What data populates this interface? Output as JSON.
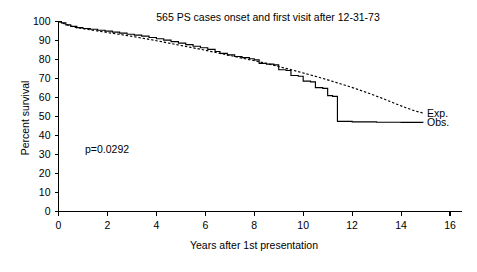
{
  "chart_data": {
    "type": "line",
    "title": "565 PS cases onset and first visit after 12-31-73",
    "xlabel": "Years after 1st presentation",
    "ylabel": "Percent survival",
    "xlim": [
      0,
      16
    ],
    "ylim": [
      0,
      100
    ],
    "grid": false,
    "legend_position": "right-inside",
    "annotation": "p=0.0292",
    "xticks": [
      0,
      2,
      4,
      6,
      8,
      10,
      12,
      14,
      16
    ],
    "xtick_labels": [
      "0",
      "2",
      "4",
      "6",
      "8",
      "10",
      "12",
      "14",
      "16"
    ],
    "yticks": [
      0,
      10,
      20,
      30,
      40,
      50,
      60,
      70,
      80,
      90,
      100
    ],
    "ytick_labels": [
      "0",
      "10",
      "20",
      "30",
      "40",
      "50",
      "60",
      "70",
      "80",
      "90",
      "100"
    ],
    "series": [
      {
        "name": "Obs.",
        "legend_label": "Obs.",
        "style": "solid",
        "shape": "step",
        "color": "#000000",
        "points": [
          [
            0.0,
            100.0
          ],
          [
            0.12,
            99.3
          ],
          [
            0.3,
            98.2
          ],
          [
            0.5,
            97.4
          ],
          [
            0.75,
            96.8
          ],
          [
            1.0,
            96.3
          ],
          [
            1.3,
            95.9
          ],
          [
            1.6,
            95.4
          ],
          [
            1.9,
            94.9
          ],
          [
            2.2,
            94.4
          ],
          [
            2.5,
            93.9
          ],
          [
            2.8,
            93.3
          ],
          [
            3.1,
            92.8
          ],
          [
            3.4,
            92.3
          ],
          [
            3.7,
            91.6
          ],
          [
            4.0,
            90.9
          ],
          [
            4.3,
            90.2
          ],
          [
            4.6,
            89.4
          ],
          [
            4.9,
            88.6
          ],
          [
            5.2,
            87.8
          ],
          [
            5.5,
            87.0
          ],
          [
            5.8,
            86.2
          ],
          [
            6.1,
            85.3
          ],
          [
            6.4,
            84.2
          ],
          [
            6.6,
            83.2
          ],
          [
            6.9,
            82.4
          ],
          [
            7.2,
            81.6
          ],
          [
            7.5,
            81.0
          ],
          [
            7.8,
            80.4
          ],
          [
            8.0,
            79.8
          ],
          [
            8.2,
            78.0
          ],
          [
            8.5,
            77.6
          ],
          [
            8.8,
            77.2
          ],
          [
            9.0,
            74.6
          ],
          [
            9.3,
            74.2
          ],
          [
            9.5,
            71.6
          ],
          [
            9.8,
            71.2
          ],
          [
            10.0,
            68.6
          ],
          [
            10.3,
            68.2
          ],
          [
            10.5,
            65.2
          ],
          [
            10.8,
            64.8
          ],
          [
            11.0,
            61.0
          ],
          [
            11.2,
            60.6
          ],
          [
            11.4,
            47.4
          ],
          [
            12.0,
            47.2
          ],
          [
            13.0,
            47.0
          ],
          [
            14.0,
            46.9
          ],
          [
            14.9,
            46.8
          ]
        ]
      },
      {
        "name": "Exp.",
        "legend_label": "Exp.",
        "style": "dotted",
        "shape": "smooth",
        "color": "#000000",
        "points": [
          [
            0.0,
            100.0
          ],
          [
            0.2,
            99.0
          ],
          [
            0.45,
            97.8
          ],
          [
            0.7,
            96.9
          ],
          [
            1.0,
            96.2
          ],
          [
            1.4,
            95.4
          ],
          [
            1.8,
            94.6
          ],
          [
            2.2,
            93.8
          ],
          [
            2.6,
            93.0
          ],
          [
            3.0,
            92.2
          ],
          [
            3.4,
            91.3
          ],
          [
            3.8,
            90.4
          ],
          [
            4.2,
            89.4
          ],
          [
            4.6,
            88.4
          ],
          [
            5.0,
            87.4
          ],
          [
            5.4,
            86.4
          ],
          [
            5.8,
            85.4
          ],
          [
            6.2,
            84.3
          ],
          [
            6.6,
            83.2
          ],
          [
            7.0,
            82.1
          ],
          [
            7.4,
            81.0
          ],
          [
            7.8,
            79.9
          ],
          [
            8.2,
            78.8
          ],
          [
            8.6,
            77.6
          ],
          [
            9.0,
            76.3
          ],
          [
            9.4,
            75.0
          ],
          [
            9.8,
            73.6
          ],
          [
            10.2,
            72.2
          ],
          [
            10.6,
            70.8
          ],
          [
            11.0,
            69.3
          ],
          [
            11.4,
            67.7
          ],
          [
            11.8,
            66.1
          ],
          [
            12.2,
            64.4
          ],
          [
            12.6,
            62.6
          ],
          [
            13.0,
            60.7
          ],
          [
            13.4,
            58.7
          ],
          [
            13.8,
            56.6
          ],
          [
            14.2,
            54.6
          ],
          [
            14.6,
            52.8
          ],
          [
            14.9,
            51.8
          ]
        ]
      }
    ]
  }
}
